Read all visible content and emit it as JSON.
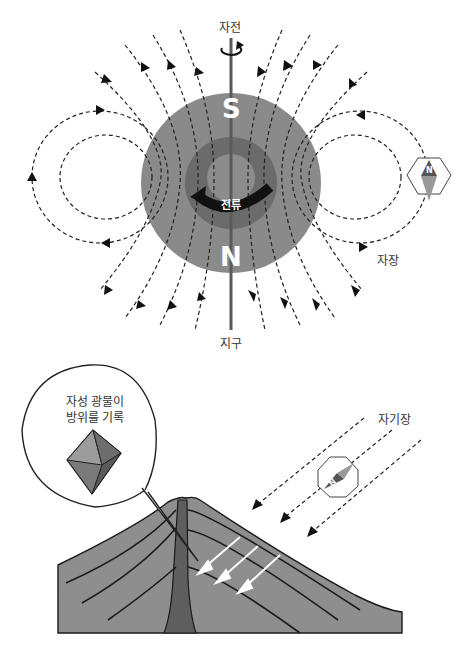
{
  "top_diagram": {
    "rotation_label": "자전",
    "earth_label": "지구",
    "field_label": "자장",
    "south_pole_label": "S",
    "north_pole_label": "N",
    "current_label": "전류",
    "compass_needle_label": "N"
  },
  "bottom_diagram": {
    "callout_line1": "자성 광물이",
    "callout_line2": "방위를 기록",
    "field_label": "자기장",
    "compass_needle_label": "N"
  },
  "colors": {
    "mantle": "#8a8a8a",
    "core": "#6b6b6b",
    "inner_core": "#8c8c8c",
    "axis": "#5a5a5a",
    "field_line": "#222222",
    "volcano": "#8e8e8e",
    "conduit": "#5e5e5e",
    "strata_line": "#1a1a1a",
    "compass_dark": "#555555",
    "compass_light": "#999999"
  }
}
